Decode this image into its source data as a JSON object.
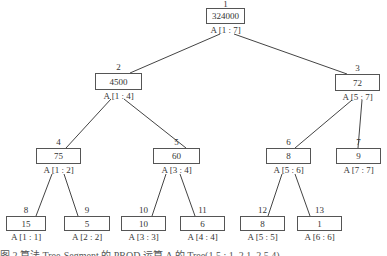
{
  "tree": {
    "nodes": [
      {
        "id": 1,
        "value": "324000",
        "range": "A [1 : 7]",
        "index": "1",
        "box": [
          206,
          8,
          39,
          16
        ]
      },
      {
        "id": 2,
        "value": "4500",
        "range": "A [1 : 4]",
        "index": "2",
        "box": [
          95,
          73,
          47,
          17
        ]
      },
      {
        "id": 3,
        "value": "72",
        "range": "A [5 : 7]",
        "index": "3",
        "box": [
          335,
          74,
          45,
          17
        ]
      },
      {
        "id": 4,
        "value": "75",
        "range": "A [1 : 2]",
        "index": "4",
        "box": [
          36,
          148,
          45,
          16
        ]
      },
      {
        "id": 5,
        "value": "60",
        "range": "A [3 : 4]",
        "index": "5",
        "box": [
          153,
          148,
          47,
          16
        ]
      },
      {
        "id": 6,
        "value": "8",
        "range": "A [5 : 6]",
        "index": "6",
        "box": [
          266,
          148,
          45,
          16
        ]
      },
      {
        "id": 7,
        "value": "9",
        "range": "A [7 : 7]",
        "index": "7",
        "box": [
          336,
          148,
          45,
          16
        ]
      },
      {
        "id": 8,
        "value": "15",
        "range": "A [1 : 1]",
        "index": "8",
        "box": [
          6,
          216,
          40,
          15
        ]
      },
      {
        "id": 9,
        "value": "5",
        "range": "A [2 : 2]",
        "index": "9",
        "box": [
          64,
          216,
          46,
          15
        ]
      },
      {
        "id": 10,
        "value": "10",
        "range": "A [3 : 3]",
        "index": "10",
        "box": [
          121,
          216,
          45,
          15
        ]
      },
      {
        "id": 11,
        "value": "6",
        "range": "A [4 : 4]",
        "index": "11",
        "box": [
          180,
          216,
          45,
          15
        ]
      },
      {
        "id": 12,
        "value": "8",
        "range": "A [5 : 5]",
        "index": "12",
        "box": [
          240,
          216,
          45,
          15
        ]
      },
      {
        "id": 13,
        "value": "1",
        "range": "A [6 : 6]",
        "index": "13",
        "box": [
          297,
          216,
          45,
          15
        ]
      }
    ],
    "edges": [
      [
        1,
        2
      ],
      [
        1,
        3
      ],
      [
        2,
        4
      ],
      [
        2,
        5
      ],
      [
        3,
        6
      ],
      [
        3,
        7
      ],
      [
        4,
        8
      ],
      [
        4,
        9
      ],
      [
        5,
        10
      ],
      [
        5,
        11
      ],
      [
        6,
        12
      ],
      [
        6,
        13
      ]
    ]
  },
  "cutoff_text": "图 2  算法 Tree-Segment 的 PROD 运算 A 的 Tree(1 5 ; 1, 2 1, 2 5 4)"
}
